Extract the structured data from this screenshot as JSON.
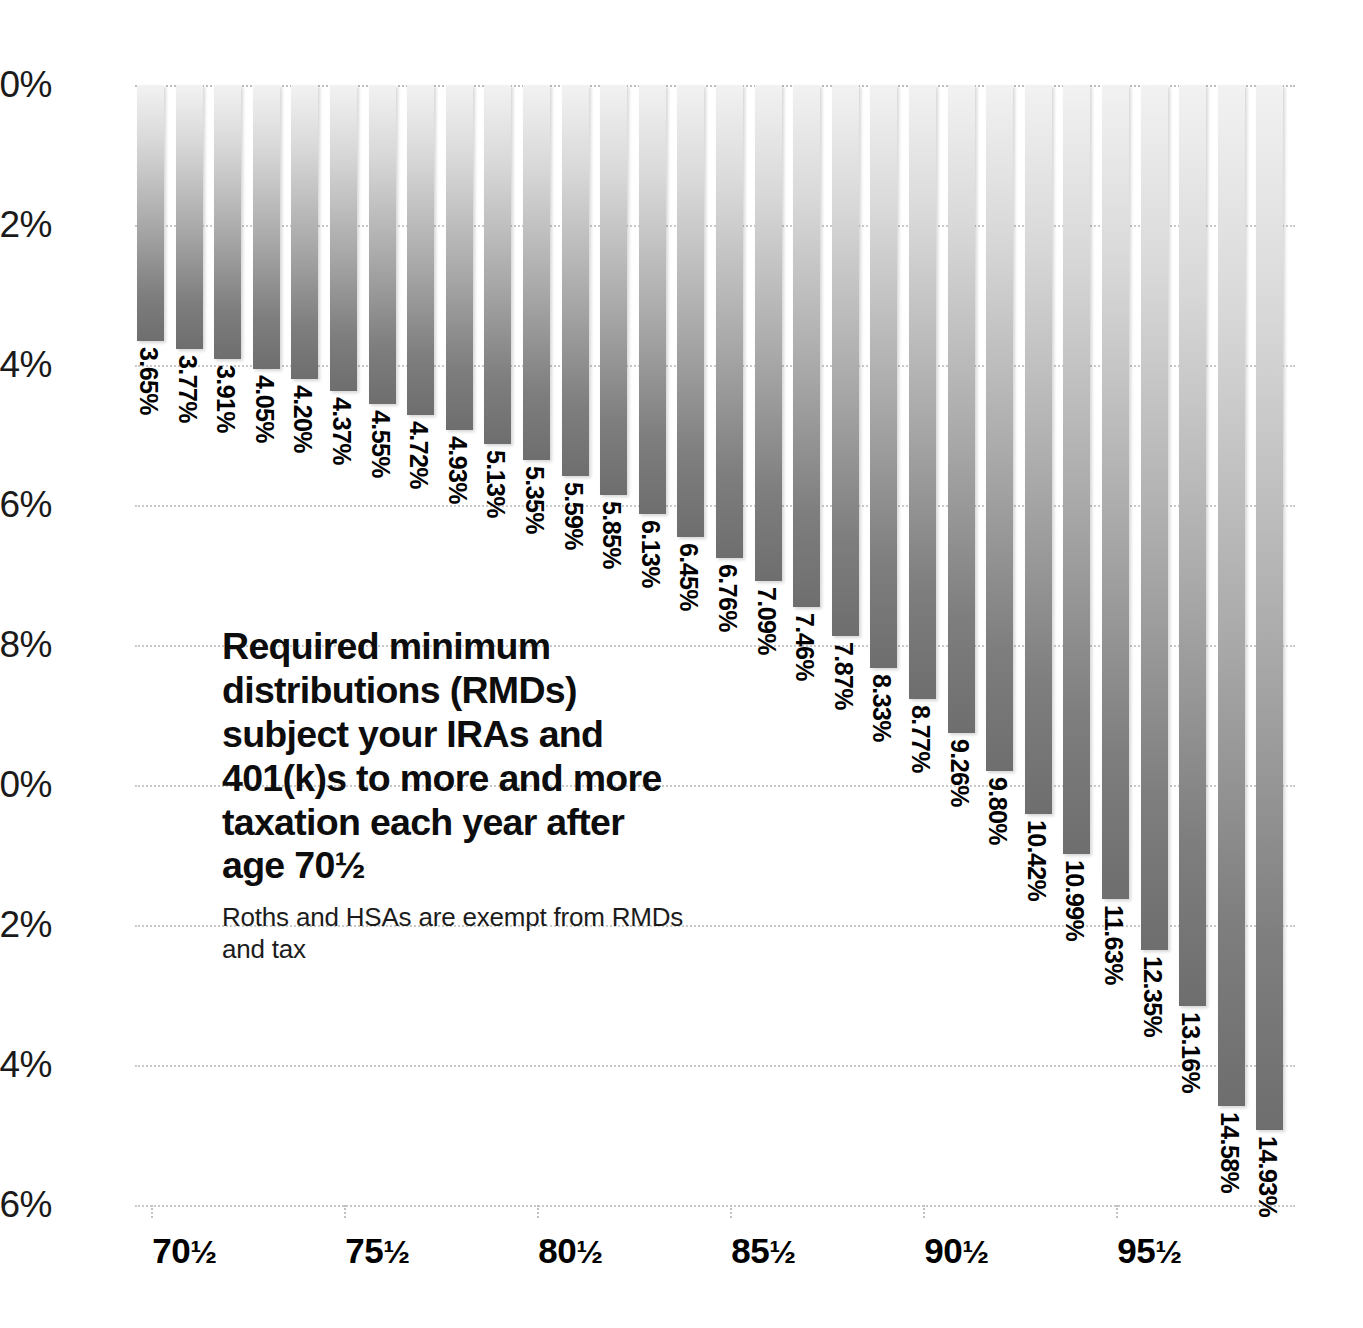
{
  "chart_data": {
    "type": "bar",
    "title": "Required minimum distributions (RMDs) subject your IRAs and 401(k)s to more and more taxation each year after age 70½",
    "subtitle": "Roths and HSAs are exempt from RMDs and tax",
    "xlabel": "",
    "ylabel": "",
    "ylim": [
      0,
      16
    ],
    "y_inverted": true,
    "grid": true,
    "legend": "none",
    "y_ticks": [
      "0%",
      "2%",
      "4%",
      "6%",
      "8%",
      "10%",
      "12%",
      "14%",
      "16%"
    ],
    "y_tick_values": [
      0,
      2,
      4,
      6,
      8,
      10,
      12,
      14,
      16
    ],
    "x_tick_labels": [
      "70½",
      "75½",
      "80½",
      "85½",
      "90½",
      "95½"
    ],
    "x_tick_indices": [
      0,
      5,
      10,
      15,
      20,
      25
    ],
    "categories": [
      "70½",
      "71½",
      "72½",
      "73½",
      "74½",
      "75½",
      "76½",
      "77½",
      "78½",
      "79½",
      "80½",
      "81½",
      "82½",
      "83½",
      "84½",
      "85½",
      "86½",
      "87½",
      "88½",
      "89½",
      "90½",
      "91½",
      "92½",
      "93½",
      "94½",
      "95½",
      "96½",
      "97½",
      "98½",
      "99½"
    ],
    "values": [
      3.65,
      3.77,
      3.91,
      4.05,
      4.2,
      4.37,
      4.55,
      4.72,
      4.93,
      5.13,
      5.35,
      5.59,
      5.85,
      6.13,
      6.45,
      6.76,
      7.09,
      7.46,
      7.87,
      8.33,
      8.77,
      9.26,
      9.8,
      10.42,
      10.99,
      11.63,
      12.35,
      13.16,
      14.58,
      14.93
    ],
    "value_labels": [
      "3.65%",
      "3.77%",
      "3.91%",
      "4.05%",
      "4.20%",
      "4.37%",
      "4.55%",
      "4.72%",
      "4.93%",
      "5.13%",
      "5.35%",
      "5.59%",
      "5.85%",
      "6.13%",
      "6.45%",
      "6.76%",
      "7.09%",
      "7.46%",
      "7.87%",
      "8.33%",
      "8.77%",
      "9.26%",
      "9.80%",
      "10.42%",
      "10.99%",
      "11.63%",
      "12.35%",
      "13.16%",
      "14.58%",
      "14.93%"
    ],
    "colors": {
      "bar_gradient_top": "#f2f2f2",
      "bar_gradient_bottom": "#6e6e6e",
      "gridline": "#c9c9c9",
      "text": "#0d0d0d",
      "background": "#ffffff"
    }
  }
}
